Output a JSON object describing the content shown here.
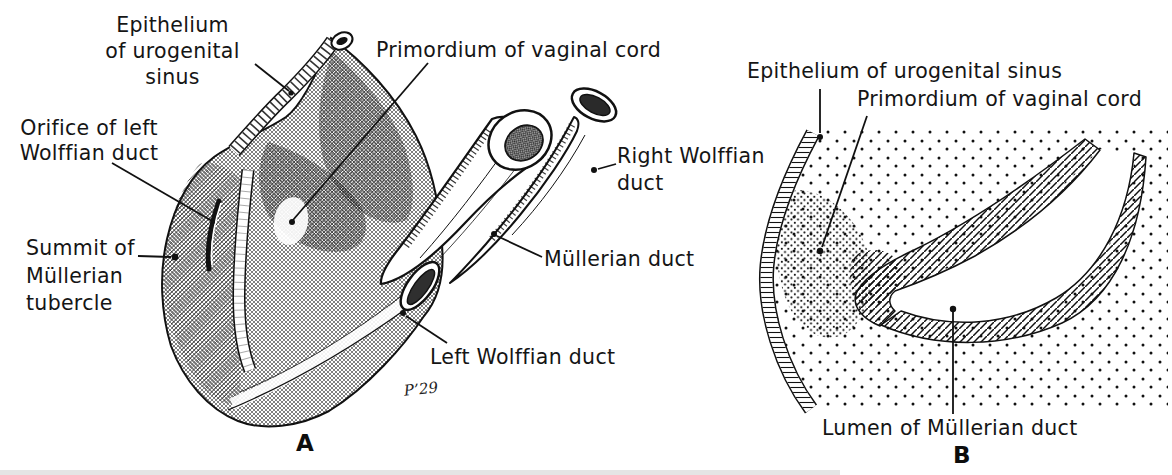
{
  "figure": {
    "colors": {
      "ink": "#1a1a1a",
      "paper": "#ffffff"
    },
    "panel_a": {
      "letter": "A",
      "labels": {
        "epithelium": "Epithelium\nof urogenital\nsinus",
        "primordium": "Primordium of vaginal cord",
        "orifice": "Orifice of left\nWolffian duct",
        "summit": "Summit of\nMüllerian\ntubercle",
        "right_wolffian": "Right Wolffian\nduct",
        "mullerian": "Müllerian duct",
        "left_wolffian": "Left Wolffian duct"
      },
      "signature": "P’29"
    },
    "panel_b": {
      "letter": "B",
      "labels": {
        "epithelium": "Epithelium of urogenital sinus",
        "primordium": "Primordium of vaginal cord",
        "lumen": "Lumen of Müllerian duct"
      }
    }
  }
}
